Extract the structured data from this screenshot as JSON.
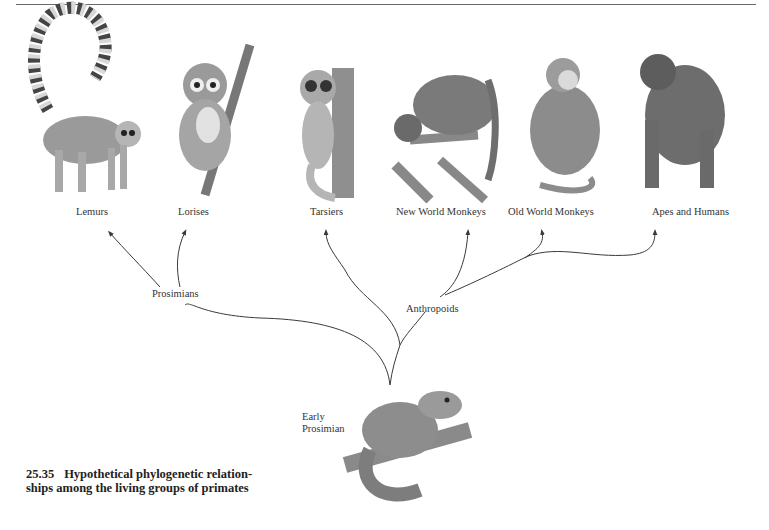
{
  "figure": {
    "number": "25.35",
    "caption": "Hypothetical phylogenetic relationships among the living groups of primates",
    "caption_line1": "Hypothetical phylogenetic relation-",
    "caption_line2": "ships among the living groups of primates"
  },
  "tree": {
    "root": {
      "label_line1": "Early",
      "label_line2": "Prosimian"
    },
    "clades": [
      {
        "name": "Prosimians",
        "children": [
          "Lemurs",
          "Lorises"
        ]
      },
      {
        "name": "Anthropoids",
        "children": [
          "Tarsiers",
          "New World Monkeys",
          "Old World Monkeys",
          "Apes and Humans"
        ]
      }
    ],
    "leaves": [
      "Lemurs",
      "Lorises",
      "Tarsiers",
      "New World Monkeys",
      "Old World Monkeys",
      "Apes and Humans"
    ]
  },
  "illustrations": [
    "ring-tailed-lemur",
    "slow-loris",
    "tarsier",
    "howler-monkey",
    "baboon",
    "gorilla",
    "tree-shrew-early-prosimian"
  ],
  "colors": {
    "line": "#3a3a3a",
    "fur_dark": "#555555",
    "fur_mid": "#8a8a8a",
    "fur_light": "#c8c8c8"
  }
}
